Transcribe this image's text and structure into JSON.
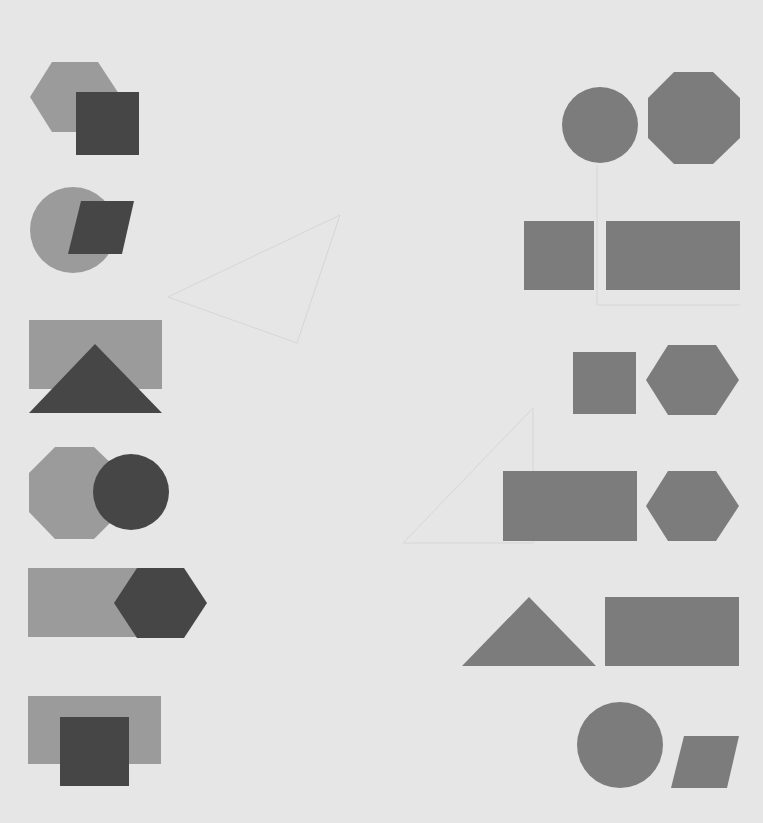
{
  "canvas": {
    "width": 763,
    "height": 823,
    "background": "#e6e6e6",
    "colors": {
      "light_shape": "#9b9b9b",
      "dark_shape": "#464646",
      "mid_shape": "#7c7c7c",
      "faint_line": "#d9d9d9"
    }
  },
  "left_column": {
    "description": "Overlapping pairs: light back shape, dark front shape",
    "pairs": [
      {
        "back": "hexagon",
        "front": "square"
      },
      {
        "back": "circle",
        "front": "parallelogram"
      },
      {
        "back": "rectangle",
        "front": "triangle"
      },
      {
        "back": "octagon",
        "front": "circle"
      },
      {
        "back": "rectangle",
        "front": "hexagon"
      },
      {
        "back": "rectangle",
        "front": "square"
      }
    ]
  },
  "right_column": {
    "description": "Side-by-side non-overlapping pairs, medium grey",
    "pairs": [
      {
        "left": "circle",
        "right": "octagon"
      },
      {
        "left": "square",
        "right": "rectangle"
      },
      {
        "left": "square",
        "right": "hexagon"
      },
      {
        "left": "rectangle",
        "right": "hexagon"
      },
      {
        "left": "triangle",
        "right": "rectangle"
      },
      {
        "left": "circle",
        "right": "parallelogram"
      }
    ]
  }
}
